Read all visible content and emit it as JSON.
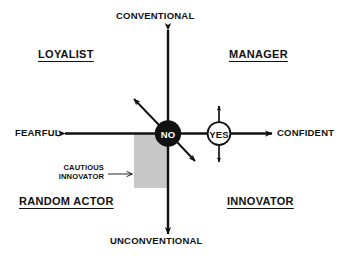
{
  "diagram": {
    "type": "quadrant-matrix",
    "colors": {
      "line": "#111111",
      "text": "#111111",
      "background": "#ffffff",
      "no_node_fill": "#111111",
      "no_node_text": "#ffffff",
      "yes_node_fill": "#ffffff",
      "yes_node_stroke": "#111111",
      "yes_node_text": "#111111",
      "highlight_region": "#c8c8c8"
    },
    "axes": {
      "vertical": {
        "top_label": "CONVENTIONAL",
        "bottom_label": "UNCONVENTIONAL"
      },
      "horizontal": {
        "left_label": "FEARFUL",
        "right_label": "CONFIDENT"
      }
    },
    "quadrants": [
      {
        "label": "LOYALIST",
        "position": "top-left"
      },
      {
        "label": "MANAGER",
        "position": "top-right"
      },
      {
        "label": "RANDOM ACTOR",
        "position": "bottom-left"
      },
      {
        "label": "INNOVATOR",
        "position": "bottom-right"
      }
    ],
    "nodes": [
      {
        "label": "NO",
        "style": "filled-black"
      },
      {
        "label": "YES",
        "style": "outlined-white"
      }
    ],
    "callout": {
      "line1": "CAUTIOUS",
      "line2": "INNOVATOR"
    }
  }
}
